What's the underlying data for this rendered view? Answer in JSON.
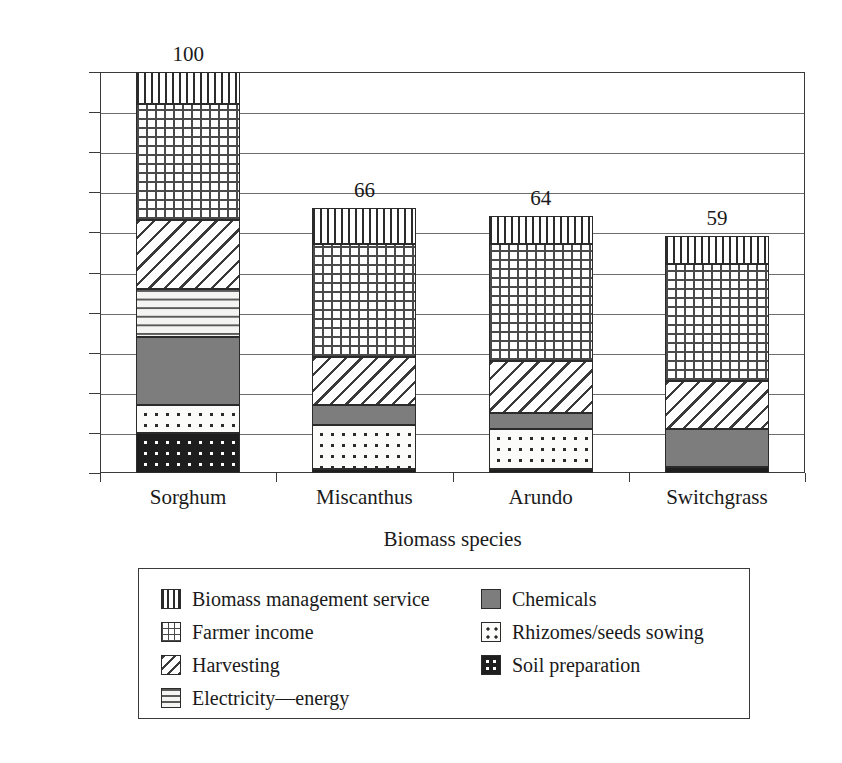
{
  "chart_data": {
    "type": "bar",
    "subtype": "stacked-bar",
    "title": "",
    "xlabel": "Biomass species",
    "ylabel": "",
    "ylim": [
      0,
      100
    ],
    "ytick_step": 10,
    "yticks": [
      0,
      10,
      20,
      30,
      40,
      50,
      60,
      70,
      80,
      90,
      100
    ],
    "grid": true,
    "legend_position": "below-axis",
    "categories": [
      "Sorghum",
      "Miscanthus",
      "Arundo",
      "Switchgrass"
    ],
    "totals": [
      100,
      66,
      64,
      59
    ],
    "total_labels": [
      "100",
      "66",
      "64",
      "59"
    ],
    "series": [
      {
        "name": "Soil preparation",
        "pattern": "dark-dotted",
        "values": [
          10,
          1,
          1,
          1.5
        ]
      },
      {
        "name": "Rhizomes/seeds sowing",
        "pattern": "light-dotted",
        "values": [
          7,
          11,
          10,
          0
        ]
      },
      {
        "name": "Chemicals",
        "pattern": "solid-gray",
        "color": "#7d7d7d",
        "values": [
          17,
          5,
          4,
          9.5
        ]
      },
      {
        "name": "Electricity—energy",
        "pattern": "fine-dashes",
        "values": [
          12,
          0,
          0,
          0
        ]
      },
      {
        "name": "Harvesting",
        "pattern": "diagonal-hatch",
        "values": [
          17,
          12,
          13,
          12
        ]
      },
      {
        "name": "Farmer income",
        "pattern": "cross-grid",
        "values": [
          29,
          28,
          29,
          29
        ]
      },
      {
        "name": "Biomass management service",
        "pattern": "vertical-lines",
        "values": [
          8,
          9,
          7,
          7
        ]
      }
    ]
  },
  "axis": {
    "x_title": "Biomass species",
    "y_tick_labels": [
      "100",
      "90",
      "80",
      "70",
      "60",
      "50",
      "40",
      "30",
      "20",
      "10",
      "0"
    ],
    "x_tick_labels": [
      "Sorghum",
      "Miscanthus",
      "Arundo",
      "Switchgrass"
    ]
  },
  "bar_value_labels": [
    "100",
    "66",
    "64",
    "59"
  ],
  "legend": {
    "left_column": [
      {
        "label": "Biomass management service",
        "swatch": "vertical-lines-swatch"
      },
      {
        "label": "Farmer income",
        "swatch": "cross-grid-swatch"
      },
      {
        "label": "Harvesting",
        "swatch": "diagonal-hatch-swatch"
      },
      {
        "label": "Electricity—energy",
        "swatch": "fine-dashes-swatch"
      }
    ],
    "right_column": [
      {
        "label": "Chemicals",
        "swatch": "solid-gray-swatch"
      },
      {
        "label": "Rhizomes/seeds sowing",
        "swatch": "light-dotted-swatch"
      },
      {
        "label": "Soil preparation",
        "swatch": "dark-dotted-swatch"
      }
    ]
  }
}
